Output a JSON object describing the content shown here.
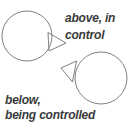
{
  "diagram": {
    "background_color": "#ffffff",
    "outline_color": "#7f7f7f",
    "text_color": "#3a3a3a",
    "top_label": {
      "line1": "above, in",
      "line2": "control"
    },
    "bottom_label": {
      "line1": "below,",
      "line2": "being controlled"
    }
  }
}
